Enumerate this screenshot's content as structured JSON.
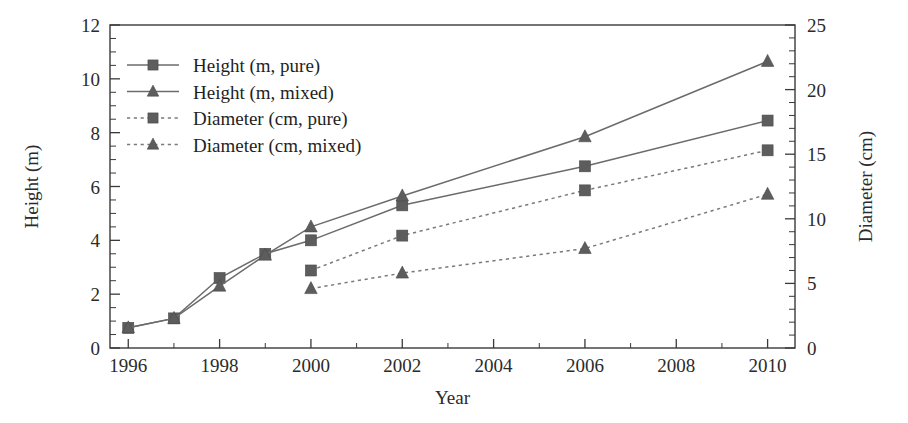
{
  "chart_data": {
    "type": "line",
    "title": "",
    "xlabel": "Year",
    "ylabel": "Height (m)",
    "y2label": "Diameter (cm)",
    "x": [
      1996,
      1997,
      1998,
      1999,
      2000,
      2002,
      2006,
      2010
    ],
    "xlim": [
      1995.6,
      2010.6
    ],
    "ylim": [
      0,
      12
    ],
    "y2lim": [
      0,
      25
    ],
    "xticks": [
      1996,
      1998,
      2000,
      2002,
      2004,
      2006,
      2008,
      2010
    ],
    "xticklabels": [
      "1996",
      "1998",
      "2000",
      "2002",
      "2004",
      "2006",
      "2008",
      "2010"
    ],
    "x_minor_step": 1,
    "yticks": [
      0,
      2,
      4,
      6,
      8,
      10,
      12
    ],
    "yticklabels": [
      "0",
      "2",
      "4",
      "6",
      "8",
      "10",
      "12"
    ],
    "y_minor_step": 0.5,
    "y2ticks": [
      0,
      5,
      10,
      15,
      20,
      25
    ],
    "y2ticklabels": [
      "0",
      "5",
      "10",
      "15",
      "20",
      "25"
    ],
    "y2_minor_step": 1,
    "grid": false,
    "legend_position": "upper-left",
    "series": [
      {
        "name": "Height (m, pure)",
        "axis": "left",
        "marker": "square",
        "linestyle": "solid",
        "color": "#5d5d5d",
        "x": [
          1996,
          1997,
          1998,
          1999,
          2000,
          2002,
          2006,
          2010
        ],
        "values": [
          0.75,
          1.1,
          2.6,
          3.5,
          4.0,
          5.3,
          6.75,
          8.45
        ]
      },
      {
        "name": "Height (m, mixed)",
        "axis": "left",
        "marker": "triangle",
        "linestyle": "solid",
        "color": "#5d5d5d",
        "x": [
          1996,
          1997,
          1998,
          1999,
          2000,
          2002,
          2006,
          2010
        ],
        "values": [
          0.75,
          1.1,
          2.3,
          3.45,
          4.5,
          5.65,
          7.85,
          10.65
        ]
      },
      {
        "name": "Diameter (cm, pure)",
        "axis": "right",
        "marker": "square",
        "linestyle": "dotted",
        "color": "#5d5d5d",
        "x": [
          2000,
          2002,
          2006,
          2010
        ],
        "values": [
          6.0,
          8.7,
          12.2,
          15.3
        ]
      },
      {
        "name": "Diameter (cm, mixed)",
        "axis": "right",
        "marker": "triangle",
        "linestyle": "dotted",
        "color": "#5d5d5d",
        "x": [
          2000,
          2002,
          2006,
          2010
        ],
        "values": [
          4.6,
          5.8,
          7.7,
          11.9
        ]
      }
    ],
    "legend": [
      {
        "label": "Height (m, pure)",
        "marker": "square",
        "linestyle": "solid"
      },
      {
        "label": "Height (m, mixed)",
        "marker": "triangle",
        "linestyle": "solid"
      },
      {
        "label": "Diameter (cm, pure)",
        "marker": "square",
        "linestyle": "dotted"
      },
      {
        "label": "Diameter (cm, mixed)",
        "marker": "triangle",
        "linestyle": "dotted"
      }
    ]
  },
  "colors": {
    "marker": "#5d5d5d",
    "line": "#6b6b6b",
    "axis": "#3a3a3a",
    "text": "#2b2b2b",
    "background": "#ffffff"
  }
}
